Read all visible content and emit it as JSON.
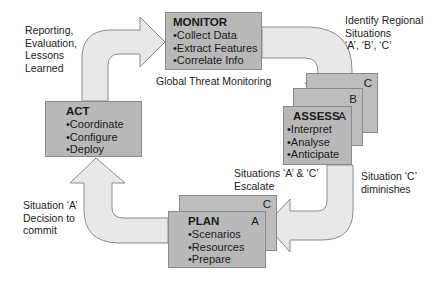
{
  "colors": {
    "box_fill": "#b8b8b8",
    "box_border": "#8a8a8a",
    "arrow_fill": "#e8e8e8",
    "arrow_stroke": "#8a8a8a"
  },
  "monitor": {
    "title": "MONITOR",
    "items": [
      "•Collect Data",
      "•Extract Features",
      "•Correlate Info"
    ],
    "caption": "Global Threat Monitoring"
  },
  "assess": {
    "title": "ASSESS",
    "items": [
      "•Interpret",
      "•Analyse",
      "•Anticipate"
    ],
    "tags": [
      "A",
      "B",
      "C"
    ]
  },
  "plan": {
    "title": "PLAN",
    "items": [
      "•Scenarios",
      "•Resources",
      "•Prepare"
    ],
    "tags": [
      "A",
      "C"
    ]
  },
  "act": {
    "title": "ACT",
    "items": [
      "•Coordinate",
      "•Configure",
      "•Deploy"
    ]
  },
  "labels": {
    "reporting": [
      "Reporting,",
      "Evaluation,",
      "Lessons",
      "Learned"
    ],
    "identify": [
      "Identify Regional",
      "Situations",
      "‘A’, ‘B’, ‘C’"
    ],
    "escalate": [
      "Situations ‘A’ & ‘C’",
      "Escalate"
    ],
    "diminishes": [
      "Situation ‘C’",
      "diminishes"
    ],
    "decision": [
      "Situation ‘A’",
      "Decision to",
      "commit"
    ]
  }
}
